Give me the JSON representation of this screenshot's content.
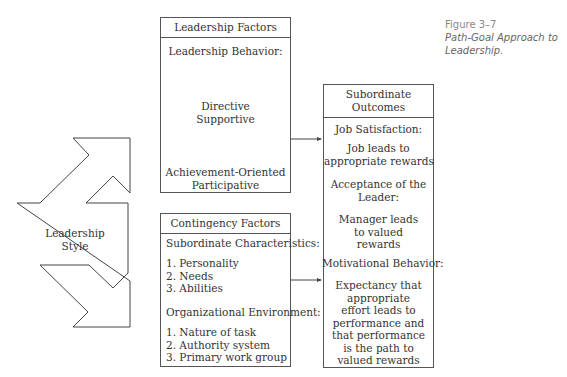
{
  "caption": {
    "figure_number": "Figure 3–7",
    "title_line1": "Path-Goal Approach to",
    "title_line2": "Leadership."
  },
  "leadership_style": {
    "line1": "Leadership",
    "line2": "Style"
  },
  "leadership_factors": {
    "header": "Leadership Factors",
    "subheading": "Leadership Behavior:",
    "group1": [
      "Directive",
      "Supportive"
    ],
    "group2": [
      "Achievement-Oriented",
      "Participative"
    ]
  },
  "contingency_factors": {
    "header": "Contingency Factors",
    "subordinate_heading": "Subordinate Characteristics:",
    "subordinate_items": [
      "1. Personality",
      "2. Needs",
      "3. Abilities"
    ],
    "environment_heading": "Organizational Environment:",
    "environment_items": [
      "1. Nature of task",
      "2. Authority system",
      "3. Primary work group"
    ]
  },
  "subordinate_outcomes": {
    "header_line1": "Subordinate",
    "header_line2": "Outcomes",
    "sections": [
      {
        "heading": [
          "Job Satisfaction:"
        ],
        "body": [
          "Job leads to",
          "appropriate rewards"
        ]
      },
      {
        "heading": [
          "Acceptance of the",
          "Leader:"
        ],
        "body": [
          "Manager leads",
          "to valued",
          "rewards"
        ]
      },
      {
        "heading": [
          "Motivational Behavior:"
        ],
        "body": [
          "Expectancy that",
          "appropriate",
          "effort leads to",
          "performance and",
          "that performance",
          "is the path to",
          "valued rewards"
        ]
      }
    ]
  }
}
